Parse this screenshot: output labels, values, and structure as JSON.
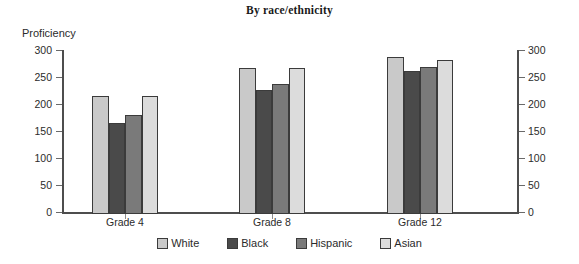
{
  "chart_data": {
    "type": "bar",
    "title": "By race/ethnicity",
    "xlabel": "",
    "ylabel": "Proficiency",
    "categories": [
      "Grade 4",
      "Grade 8",
      "Grade 12"
    ],
    "series": [
      {
        "name": "White",
        "color": "#c9c9c9",
        "values": [
          219,
          271,
          291
        ]
      },
      {
        "name": "Black",
        "color": "#4a4a4a",
        "values": [
          169,
          230,
          265
        ]
      },
      {
        "name": "Hispanic",
        "color": "#7a7a7a",
        "values": [
          184,
          241,
          272
        ]
      },
      {
        "name": "Asian",
        "color": "#dcdcdc",
        "values": [
          219,
          271,
          285
        ]
      }
    ],
    "ylim": [
      0,
      300
    ],
    "yticks": [
      0,
      50,
      100,
      150,
      200,
      250,
      300
    ],
    "ytick_labels": [
      "0",
      "50",
      "100",
      "150",
      "200",
      "250",
      "300"
    ],
    "right_axis": {
      "ticks": [
        0,
        50,
        100,
        150,
        200,
        250,
        300
      ],
      "labels": [
        "0",
        "50",
        "100",
        "150",
        "200",
        "250",
        "300"
      ]
    },
    "grid": false,
    "legend_position": "bottom"
  }
}
